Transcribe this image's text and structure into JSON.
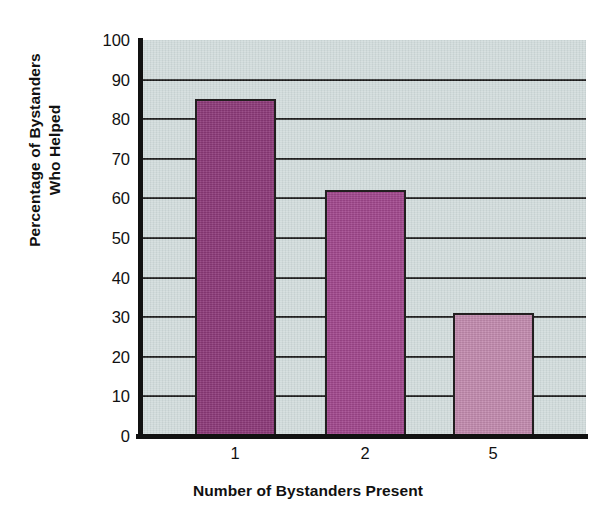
{
  "chart_data": {
    "type": "bar",
    "title": "",
    "categories": [
      "1",
      "2",
      "5"
    ],
    "values": [
      85,
      62,
      31
    ],
    "series": [
      {
        "name": "Percentage of Bystanders Who Helped",
        "values": [
          85,
          62,
          31
        ]
      }
    ],
    "xlabel": "Number of Bystanders Present",
    "ylabel": "Percentage of Bystanders Who Helped",
    "ylabel_lines": [
      "Percentage of Bystanders",
      "Who Helped"
    ],
    "ylim": [
      0,
      100
    ],
    "ytick_values": [
      0,
      10,
      20,
      30,
      40,
      50,
      60,
      70,
      80,
      90,
      100
    ],
    "ytick_labels": [
      "0",
      "10",
      "20",
      "30",
      "40",
      "50",
      "60",
      "70",
      "80",
      "90",
      "100"
    ],
    "xtick_labels": [
      "1",
      "2",
      "5"
    ],
    "grid": "horizontal",
    "legend": "none",
    "bar_colors": [
      "#8e3a7a",
      "#a2488e",
      "#c48cb0"
    ],
    "bar_edge_color": "#231f20",
    "plot_background": "#cdd8d8",
    "axis_color": "#111111",
    "page_background": "#ffffff"
  }
}
